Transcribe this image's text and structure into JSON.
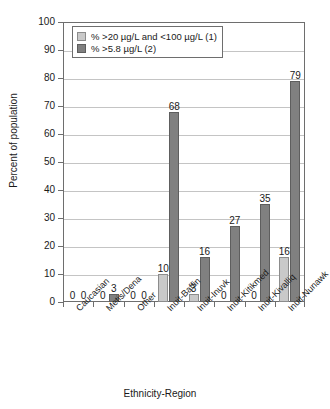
{
  "chart_data": {
    "type": "bar",
    "title": "",
    "xlabel": "Ethnicity-Region",
    "ylabel": "Percent of population",
    "ylim": [
      0,
      100
    ],
    "ytick_step": 10,
    "yticks": [
      "0",
      "10",
      "20",
      "30",
      "40",
      "50",
      "60",
      "70",
      "80",
      "90",
      "100"
    ],
    "grid": true,
    "grid_axis": "y",
    "legend_position": "top-left-inside",
    "categories": [
      "Caucasian",
      "Metis/Dena",
      "Other",
      "Inuit-Baffin",
      "Inuit-Inuvk",
      "Inuit-Kitikmed",
      "Inuit-Kivalliq",
      "Inuit-Nunawk"
    ],
    "series": [
      {
        "name": "% >20 µg/L and <100 µg/L (1)",
        "color": "#c9c9c9",
        "values": [
          0,
          0,
          0,
          10,
          3,
          0,
          0,
          16
        ]
      },
      {
        "name": "% >5.8 µg/L (2)",
        "color": "#808080",
        "values": [
          0,
          3,
          0,
          68,
          16,
          27,
          35,
          79
        ]
      }
    ],
    "data_labels": [
      [
        "0",
        "0"
      ],
      [
        "0",
        "3"
      ],
      [
        "0",
        "0"
      ],
      [
        "10",
        "68"
      ],
      [
        "3",
        "16"
      ],
      [
        "0",
        "27"
      ],
      [
        "0",
        "35"
      ],
      [
        "16",
        "79"
      ]
    ]
  },
  "legend": {
    "items": [
      {
        "label": "% >20 µg/L and <100 µg/L (1)",
        "color": "#c9c9c9"
      },
      {
        "label": "% >5.8 µg/L (2)",
        "color": "#808080"
      }
    ]
  },
  "colors": {
    "series1": "#c9c9c9",
    "series2": "#808080",
    "axis": "#6e6e6e",
    "grid": "#c4c4c4",
    "text": "#1a1a1a",
    "background": "#ffffff"
  }
}
